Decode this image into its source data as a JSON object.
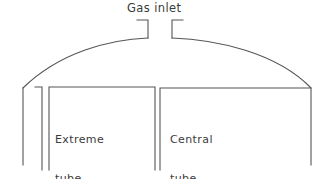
{
  "figure": {
    "kind": "technical-cross-section-diagram",
    "background_color": "#ffffff",
    "line_color": "#555555",
    "text_color": "#3b3b3b"
  },
  "labels": {
    "gas_inlet": "Gas inlet",
    "extreme_tube_line1": "Extreme",
    "extreme_tube_line2": "tube",
    "central_tube_line1": "Central",
    "central_tube_line2": "tube"
  },
  "geometry": {
    "vessel_left_wall_x": 23,
    "vessel_right_wall_x": 311,
    "vessel_wall_top_y": 88,
    "vessel_wall_bottom_y": 165,
    "dome_apex_y": 38,
    "inlet_left_stub_x": 148,
    "inlet_right_stub_x": 172,
    "inlet_stub_top_y": 20,
    "inlet_stub_bottom_y": 38,
    "extreme_tube_left_x": 49,
    "extreme_tube_right_x": 155,
    "extreme_tube_top_y": 87,
    "extreme_tube_bottom_y": 170,
    "extreme_tube_inner_divider_x": 42,
    "central_tube_left_x": 160,
    "central_tube_top_y": 88,
    "central_tube_bottom_y": 170
  }
}
